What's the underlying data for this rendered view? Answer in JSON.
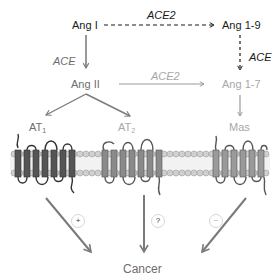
{
  "diagram": {
    "nodes": {
      "ang1": "Ang I",
      "ang19": "Ang 1-9",
      "ang2": "Ang II",
      "ang17": "Ang 1-7",
      "at1_base": "AT",
      "at1_sub": "1",
      "at2_base": "AT",
      "at2_sub": "2",
      "mas": "Mas",
      "cancer": "Cancer"
    },
    "enzymes": {
      "ang1_to_ang19": "ACE2",
      "ang1_to_ang2": "ACE",
      "ang19_to_ang17": "ACE",
      "ang2_to_ang17": "ACE2"
    },
    "effects": {
      "at1": "+",
      "at2": "?",
      "mas": "−"
    },
    "colors": {
      "dark": "#1a1a1a",
      "mid_gray": "#6e6e6e",
      "light_gray": "#a8a8a8",
      "arrow_gray": "#7a7a7a",
      "membrane": "#bdbdbd",
      "receptor_dark": "#555555",
      "receptor_light": "#8a8a8a"
    }
  }
}
